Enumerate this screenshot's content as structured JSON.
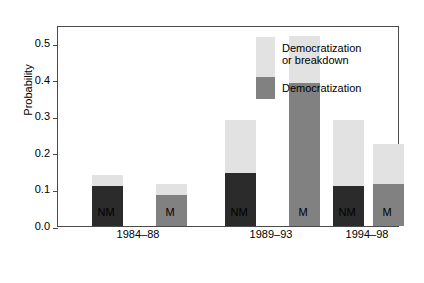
{
  "chart_data": {
    "type": "bar",
    "title": "",
    "xlabel": "",
    "ylabel": "Probability",
    "ylim": [
      0.0,
      0.55
    ],
    "yticks": [
      "0.0",
      "0.1",
      "0.2",
      "0.3",
      "0.4",
      "0.5"
    ],
    "ytick_values": [
      0.0,
      0.1,
      0.2,
      0.3,
      0.4,
      0.5
    ],
    "grid": false,
    "stacked": true,
    "legend_position": "inside-top-right",
    "groups": [
      "1984–88",
      "1989–93",
      "1994–98"
    ],
    "categories": [
      "NM",
      "M",
      "NM",
      "M",
      "NM",
      "M"
    ],
    "series": [
      {
        "name": "Democratization",
        "color": "#2b2b2b",
        "values": [
          0.11,
          0.085,
          0.145,
          0.39,
          0.11,
          0.115
        ]
      },
      {
        "name": "Democratization or breakdown",
        "color": "#e2e2e2",
        "values": [
          0.03,
          0.03,
          0.145,
          0.13,
          0.18,
          0.11
        ]
      }
    ],
    "totals": [
      0.14,
      0.115,
      0.29,
      0.52,
      0.29,
      0.225
    ],
    "bars": [
      {
        "group": "1984–88",
        "category": "NM",
        "dark": 0.11,
        "total": 0.14,
        "dark_color": "#2b2b2b"
      },
      {
        "group": "1984–88",
        "category": "M",
        "dark": 0.085,
        "total": 0.115,
        "dark_color": "#818181"
      },
      {
        "group": "1989–93",
        "category": "NM",
        "dark": 0.145,
        "total": 0.29,
        "dark_color": "#2b2b2b"
      },
      {
        "group": "1989–93",
        "category": "M",
        "dark": 0.39,
        "total": 0.52,
        "dark_color": "#818181"
      },
      {
        "group": "1994–98",
        "category": "NM",
        "dark": 0.11,
        "total": 0.29,
        "dark_color": "#2b2b2b"
      },
      {
        "group": "1994–98",
        "category": "M",
        "dark": 0.115,
        "total": 0.225,
        "dark_color": "#818181"
      }
    ],
    "legend": [
      {
        "label_line1": "Democratization",
        "label_line2": "or breakdown",
        "color": "#e2e2e2"
      },
      {
        "label_line1": "Democratization",
        "label_line2": "",
        "color": "#818181"
      }
    ]
  }
}
